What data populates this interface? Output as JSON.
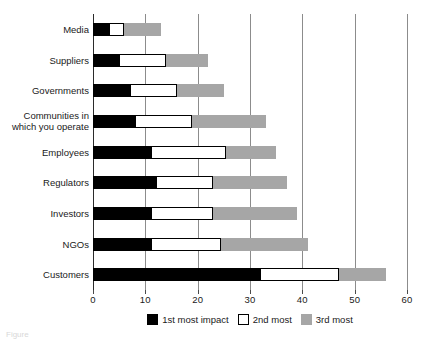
{
  "chart_data": {
    "type": "bar",
    "orientation": "horizontal",
    "stacked": true,
    "title": "",
    "xlabel": "",
    "ylabel": "",
    "xlim": [
      0,
      60
    ],
    "xticks": [
      0,
      10,
      20,
      30,
      40,
      50,
      60
    ],
    "xtick_labels": [
      "0",
      "10",
      "20",
      "30",
      "40",
      "50",
      "60"
    ],
    "grid": "vertical",
    "legend_position": "bottom-center",
    "categories": [
      "Media",
      "Suppliers",
      "Governments",
      "Communities in\nwhich you operate",
      "Employees",
      "Regulators",
      "Investors",
      "NGOs",
      "Customers"
    ],
    "series": [
      {
        "name": "1st most impact",
        "color": "#000000",
        "values": [
          3,
          5,
          7,
          8,
          11,
          12,
          11,
          11,
          32
        ]
      },
      {
        "name": "2nd most",
        "color": "#ffffff",
        "values": [
          3,
          9,
          9,
          11,
          14.5,
          11,
          12,
          13.5,
          15
        ]
      },
      {
        "name": "3rd most",
        "color": "#a6a6a6",
        "values": [
          7,
          8,
          9,
          14,
          9.5,
          14,
          16,
          16.5,
          9
        ]
      }
    ],
    "totals": [
      13,
      22,
      25,
      33,
      35,
      37,
      39,
      41,
      56
    ]
  },
  "legend": {
    "items": [
      {
        "label": "1st most impact",
        "swatch": "first"
      },
      {
        "label": "2nd most",
        "swatch": "second"
      },
      {
        "label": "3rd most",
        "swatch": "third"
      }
    ]
  },
  "caption": {
    "text": "Figure"
  },
  "colors": {
    "first": "#000000",
    "second": "#ffffff",
    "third": "#a6a6a6",
    "axis": "#2b2b2b",
    "grid": "#8c8c8c",
    "text": "#1a1a1a"
  }
}
